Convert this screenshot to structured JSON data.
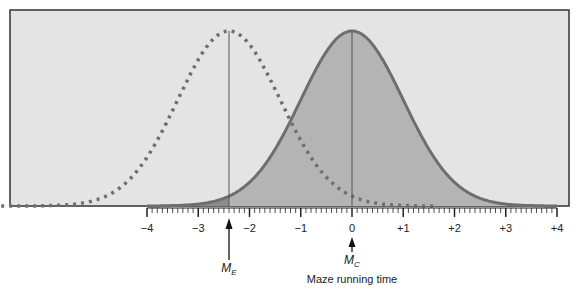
{
  "chart_data": {
    "type": "area",
    "title": "",
    "xlabel": "Maze running time",
    "ylabel": "",
    "xlim": [
      -4,
      4
    ],
    "x_ticks": [
      -4,
      -3,
      -2,
      -1,
      0,
      1,
      2,
      3,
      4
    ],
    "x_tick_labels": [
      "−4",
      "−3",
      "−2",
      "−1",
      "0",
      "+1",
      "+2",
      "+3",
      "+4"
    ],
    "minor_ticks_per_unit": 10,
    "grid": false,
    "legend": null,
    "series": [
      {
        "name": "Control distribution",
        "style": "solid, shaded",
        "mean": 0,
        "sd": 1,
        "marker_label": "M_C"
      },
      {
        "name": "Experimental distribution",
        "style": "dotted",
        "mean": -2.4,
        "sd": 1,
        "marker_label": "M_E"
      }
    ],
    "annotations": [
      {
        "text": "M_E",
        "x": -2.4,
        "type": "arrow"
      },
      {
        "text": "M_C",
        "x": 0,
        "type": "arrow"
      }
    ],
    "shaded_region": {
      "description": "Area under control curve; darker region left of M_E",
      "dark_from": -4,
      "dark_to": -2.4
    }
  },
  "labels": {
    "xlabel": "Maze running time",
    "me_main": "M",
    "me_sub": "E",
    "mc_main": "M",
    "mc_sub": "C",
    "ticks": [
      "−4",
      "−3",
      "−2",
      "−1",
      "0",
      "+1",
      "+2",
      "+3",
      "+4"
    ]
  },
  "colors": {
    "background_panel": "#e4e4e4",
    "curve_line": "#6e6e6e",
    "shade_light": "#b4b4b4",
    "shade_dark": "#8c8c8c",
    "dotted": "#6e6e6e"
  }
}
